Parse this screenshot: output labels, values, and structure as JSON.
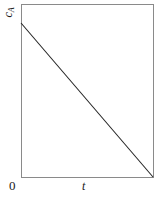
{
  "chart_data": {
    "type": "line",
    "title": "",
    "subtitle": "",
    "xlabel": "t",
    "ylabel": "c",
    "ylabel_subscript": "A",
    "ylabel_full": "cA",
    "origin_label": "0",
    "grid": false,
    "legend": null,
    "xlim": [
      0,
      1
    ],
    "ylim": [
      0,
      1
    ],
    "xticks": [],
    "yticks": [],
    "xticklabels": [],
    "yticklabels": [],
    "series": [
      {
        "name": "cA",
        "x": [
          0,
          1
        ],
        "y": [
          0.89,
          0
        ]
      }
    ],
    "annotations": [],
    "colors": {
      "line": "#222222",
      "frame": "#8a8a8a",
      "background": "#ffffff",
      "text": "#1a1a1a"
    }
  },
  "figure": {
    "width": 163,
    "height": 199,
    "frame": {
      "left": 21,
      "top": 4,
      "right": 153,
      "bottom": 177
    },
    "line_points": {
      "start_x": 21,
      "start_y": 23,
      "end_x": 153,
      "end_y": 177
    }
  }
}
